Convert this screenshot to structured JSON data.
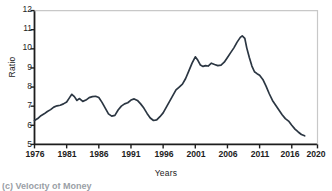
{
  "chart_data": {
    "type": "line",
    "title": "",
    "xlabel": "Years",
    "ylabel": "Ratio",
    "xlim": [
      1976,
      2020
    ],
    "ylim": [
      5,
      12
    ],
    "grid": false,
    "legend": null,
    "line_color": "#2b3642",
    "axis_color": "#1d1d1d",
    "xticks": [
      1976,
      1981,
      1986,
      1991,
      1996,
      2001,
      2006,
      2011,
      2016,
      2020
    ],
    "xtick_labels": [
      "1976",
      "1981",
      "1986",
      "1991",
      "1996",
      "2001",
      "2006",
      "2011",
      "2016",
      "2020"
    ],
    "yticks": [
      5,
      6,
      7,
      8,
      9,
      10,
      11,
      12
    ],
    "ytick_labels": [
      "5",
      "6",
      "7",
      "8",
      "9",
      "10",
      "11",
      "12"
    ],
    "series": [
      {
        "name": "Velocity of Money",
        "x": [
          1976.0,
          1976.5,
          1977.0,
          1977.5,
          1978.0,
          1978.5,
          1979.0,
          1979.5,
          1980.0,
          1980.5,
          1981.0,
          1981.4,
          1981.8,
          1982.2,
          1982.6,
          1983.0,
          1983.5,
          1984.0,
          1984.5,
          1985.0,
          1985.5,
          1986.0,
          1986.5,
          1987.0,
          1987.5,
          1988.0,
          1988.5,
          1989.0,
          1989.5,
          1990.0,
          1990.5,
          1991.0,
          1991.5,
          1992.0,
          1992.5,
          1993.0,
          1993.5,
          1994.0,
          1994.5,
          1995.0,
          1995.5,
          1996.0,
          1996.5,
          1997.0,
          1997.5,
          1998.0,
          1998.5,
          1999.0,
          1999.5,
          2000.0,
          2000.5,
          2001.0,
          2001.4,
          2001.8,
          2002.2,
          2002.6,
          2003.0,
          2003.5,
          2004.0,
          2004.5,
          2005.0,
          2005.5,
          2006.0,
          2006.5,
          2007.0,
          2007.5,
          2008.0,
          2008.3,
          2008.7,
          2009.0,
          2009.4,
          2009.8,
          2010.2,
          2010.6,
          2011.0,
          2011.5,
          2012.0,
          2012.5,
          2013.0,
          2013.5,
          2014.0,
          2014.5,
          2015.0,
          2015.5,
          2016.0,
          2016.5,
          2017.0,
          2017.5,
          2018.0
        ],
        "y": [
          6.25,
          6.35,
          6.5,
          6.6,
          6.72,
          6.82,
          6.95,
          7.02,
          7.05,
          7.12,
          7.22,
          7.42,
          7.62,
          7.5,
          7.3,
          7.4,
          7.25,
          7.32,
          7.45,
          7.5,
          7.52,
          7.45,
          7.2,
          6.9,
          6.6,
          6.48,
          6.52,
          6.8,
          7.0,
          7.12,
          7.18,
          7.32,
          7.38,
          7.3,
          7.12,
          6.9,
          6.62,
          6.38,
          6.25,
          6.28,
          6.45,
          6.65,
          6.95,
          7.25,
          7.55,
          7.85,
          8.0,
          8.15,
          8.45,
          8.85,
          9.25,
          9.58,
          9.4,
          9.15,
          9.08,
          9.12,
          9.1,
          9.25,
          9.18,
          9.12,
          9.15,
          9.3,
          9.55,
          9.8,
          10.05,
          10.35,
          10.6,
          10.68,
          10.55,
          10.05,
          9.55,
          9.1,
          8.8,
          8.7,
          8.62,
          8.4,
          8.05,
          7.65,
          7.3,
          7.05,
          6.8,
          6.55,
          6.35,
          6.22,
          6.0,
          5.8,
          5.65,
          5.52,
          5.45
        ]
      }
    ],
    "notable_points": [
      {
        "year": 1976,
        "value": 6.25,
        "note": "series start"
      },
      {
        "year": 1981.8,
        "value": 7.62,
        "note": "early peak"
      },
      {
        "year": 1994.3,
        "value": 6.25,
        "note": "mid-1990s trough"
      },
      {
        "year": 2001,
        "value": 9.58,
        "note": "2001 local peak"
      },
      {
        "year": 2008.3,
        "value": 10.68,
        "note": "all-time peak"
      },
      {
        "year": 2018,
        "value": 5.45,
        "note": "series end"
      }
    ]
  },
  "caption": {
    "clipped_text": "(c) Velocity of Money"
  }
}
